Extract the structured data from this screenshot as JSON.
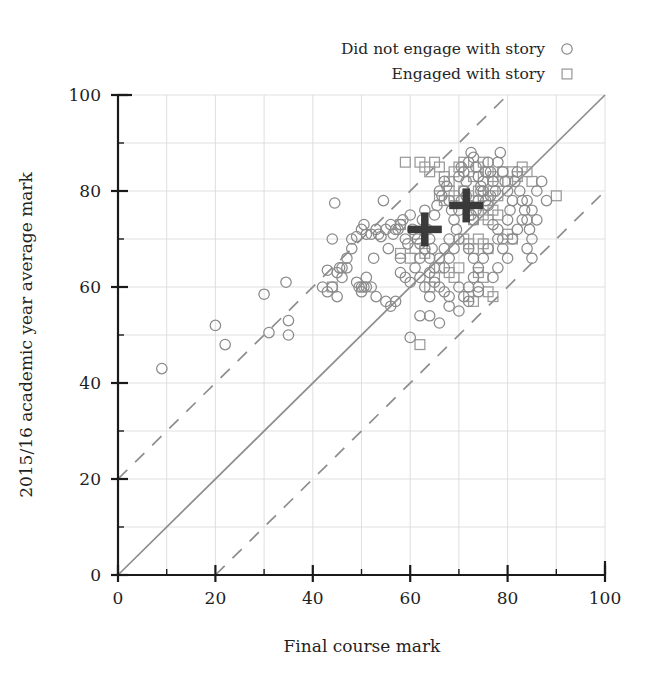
{
  "chart_data": {
    "type": "scatter",
    "title": "",
    "xlabel": "Final course mark",
    "ylabel": "2015/16 academic year average mark",
    "xlim": [
      0,
      100
    ],
    "ylim": [
      0,
      100
    ],
    "xticks": [
      0,
      20,
      40,
      60,
      80,
      100
    ],
    "yticks": [
      0,
      20,
      40,
      60,
      80,
      100
    ],
    "xticklabels": [
      "0",
      "20",
      "40",
      "60",
      "80",
      "100"
    ],
    "yticklabels": [
      "0",
      "20",
      "40",
      "60",
      "80",
      "100"
    ],
    "minor_tick_step": 10,
    "grid": true,
    "grid_step": 10,
    "legend_position": "above-right",
    "legend": [
      {
        "label": "Did not engage with story",
        "marker": "circle",
        "color": "#8a8a8a"
      },
      {
        "label": "Engaged with story",
        "marker": "square",
        "color": "#9a9a9a"
      }
    ],
    "reference_lines": [
      {
        "name": "identity",
        "style": "solid",
        "color": "#8d8d8d",
        "intercept": 0,
        "slope": 1
      },
      {
        "name": "upper-band",
        "style": "dashed",
        "color": "#8d8d8d",
        "intercept": 20,
        "slope": 1
      },
      {
        "name": "lower-band",
        "style": "dashed",
        "color": "#8d8d8d",
        "intercept": -20,
        "slope": 1
      }
    ],
    "centroids": [
      {
        "name": "did-not-engage-mean",
        "x": 63,
        "y": 72,
        "marker": "plus",
        "color": "#3a3a3a"
      },
      {
        "name": "engaged-mean",
        "x": 71.5,
        "y": 77,
        "marker": "plus",
        "color": "#3a3a3a"
      }
    ],
    "series": [
      {
        "name": "Did not engage with story",
        "marker": "circle",
        "color": "#8a8a8a",
        "points": [
          [
            9,
            43
          ],
          [
            20,
            52
          ],
          [
            22,
            48
          ],
          [
            30,
            58.5
          ],
          [
            31,
            50.5
          ],
          [
            35,
            50
          ],
          [
            34.5,
            61
          ],
          [
            35,
            53
          ],
          [
            43,
            63.5
          ],
          [
            44,
            70
          ],
          [
            44.5,
            77.5
          ],
          [
            45,
            63
          ],
          [
            45.5,
            64
          ],
          [
            46,
            64
          ],
          [
            47,
            64
          ],
          [
            48,
            70
          ],
          [
            49,
            70.5
          ],
          [
            49.5,
            60
          ],
          [
            50,
            60
          ],
          [
            50.5,
            60
          ],
          [
            51,
            60
          ],
          [
            50,
            72
          ],
          [
            50.5,
            73
          ],
          [
            51,
            71
          ],
          [
            52,
            71
          ],
          [
            52.5,
            66
          ],
          [
            53,
            72
          ],
          [
            53.5,
            71
          ],
          [
            54,
            70.5
          ],
          [
            54.5,
            78
          ],
          [
            55,
            72
          ],
          [
            55.5,
            68
          ],
          [
            56,
            73
          ],
          [
            56.5,
            71
          ],
          [
            57,
            72
          ],
          [
            57.5,
            72
          ],
          [
            55,
            57
          ],
          [
            56,
            56
          ],
          [
            57,
            57
          ],
          [
            58,
            66
          ],
          [
            58,
            73
          ],
          [
            58.5,
            74
          ],
          [
            59,
            70
          ],
          [
            59.5,
            69
          ],
          [
            60,
            75
          ],
          [
            60.5,
            72
          ],
          [
            61,
            71
          ],
          [
            61.5,
            70
          ],
          [
            62,
            69
          ],
          [
            62.5,
            74
          ],
          [
            63,
            76
          ],
          [
            63.5,
            72
          ],
          [
            64,
            70
          ],
          [
            64.5,
            68
          ],
          [
            65,
            75
          ],
          [
            65.5,
            77
          ],
          [
            66,
            80
          ],
          [
            66.5,
            79
          ],
          [
            67,
            82
          ],
          [
            67.5,
            81
          ],
          [
            68,
            78
          ],
          [
            68.5,
            76
          ],
          [
            69,
            74
          ],
          [
            69.5,
            72
          ],
          [
            70,
            70
          ],
          [
            58,
            63
          ],
          [
            59,
            62
          ],
          [
            60,
            61
          ],
          [
            61,
            64
          ],
          [
            62,
            62
          ],
          [
            63,
            60
          ],
          [
            64,
            63
          ],
          [
            65,
            61
          ],
          [
            60,
            49.5
          ],
          [
            62,
            54
          ],
          [
            64,
            58
          ],
          [
            66,
            60
          ],
          [
            67,
            64
          ],
          [
            68,
            66
          ],
          [
            69,
            68
          ],
          [
            70,
            83
          ],
          [
            70.5,
            85
          ],
          [
            71,
            84
          ],
          [
            71.5,
            82
          ],
          [
            72,
            86
          ],
          [
            72.5,
            88
          ],
          [
            73,
            87
          ],
          [
            73.5,
            85
          ],
          [
            74,
            83
          ],
          [
            74.5,
            81
          ],
          [
            75,
            80
          ],
          [
            75.5,
            78
          ],
          [
            76,
            77
          ],
          [
            76.5,
            79
          ],
          [
            70,
            76
          ],
          [
            70.5,
            78
          ],
          [
            71,
            80
          ],
          [
            71.5,
            79
          ],
          [
            72,
            77
          ],
          [
            72.5,
            75
          ],
          [
            73,
            74
          ],
          [
            73.5,
            76
          ],
          [
            74,
            78
          ],
          [
            74.5,
            80
          ],
          [
            75,
            82
          ],
          [
            75.5,
            84
          ],
          [
            76,
            86
          ],
          [
            76.5,
            84
          ],
          [
            77,
            82
          ],
          [
            77.5,
            80
          ],
          [
            78,
            86
          ],
          [
            78.5,
            88
          ],
          [
            79,
            84
          ],
          [
            79.5,
            82
          ],
          [
            80,
            80
          ],
          [
            77,
            73
          ],
          [
            78,
            72
          ],
          [
            79,
            70
          ],
          [
            80,
            74
          ],
          [
            80.5,
            76
          ],
          [
            81,
            78
          ],
          [
            81.5,
            82
          ],
          [
            82,
            84
          ],
          [
            82.5,
            80
          ],
          [
            83,
            78
          ],
          [
            83.5,
            76
          ],
          [
            84,
            74
          ],
          [
            84.5,
            72
          ],
          [
            85,
            70
          ],
          [
            72,
            68
          ],
          [
            73,
            66
          ],
          [
            74,
            64
          ],
          [
            75,
            66
          ],
          [
            76,
            68
          ],
          [
            77,
            62
          ],
          [
            78,
            64
          ],
          [
            67,
            59
          ],
          [
            68,
            58
          ],
          [
            70,
            60
          ],
          [
            71,
            58
          ],
          [
            72,
            60
          ],
          [
            73,
            62
          ],
          [
            74,
            60
          ],
          [
            64,
            54
          ],
          [
            66,
            52.5
          ],
          [
            68,
            56
          ],
          [
            70,
            55
          ],
          [
            72,
            57
          ],
          [
            74,
            59
          ],
          [
            62,
            66
          ],
          [
            63,
            68
          ],
          [
            64,
            66
          ],
          [
            65,
            64
          ],
          [
            66,
            66
          ],
          [
            67,
            68
          ],
          [
            68,
            70
          ],
          [
            49,
            61
          ],
          [
            50,
            59
          ],
          [
            51,
            62
          ],
          [
            52,
            60
          ],
          [
            53,
            58
          ],
          [
            47,
            66
          ],
          [
            48,
            68
          ],
          [
            44,
            60
          ],
          [
            45,
            58
          ],
          [
            46,
            62
          ],
          [
            43,
            59
          ],
          [
            42,
            60
          ],
          [
            86,
            80
          ],
          [
            87,
            82
          ],
          [
            88,
            78
          ],
          [
            85,
            76
          ],
          [
            86,
            74
          ],
          [
            84,
            68
          ],
          [
            85,
            66
          ],
          [
            78,
            70
          ],
          [
            79,
            68
          ],
          [
            80,
            66
          ],
          [
            81,
            70
          ],
          [
            82,
            72
          ],
          [
            83,
            74
          ],
          [
            84,
            78
          ]
        ]
      },
      {
        "name": "Engaged with story",
        "marker": "square",
        "color": "#9a9a9a",
        "points": [
          [
            44,
            60
          ],
          [
            58,
            73
          ],
          [
            59,
            86
          ],
          [
            62,
            86
          ],
          [
            63,
            85
          ],
          [
            64,
            84
          ],
          [
            65,
            86
          ],
          [
            66,
            85
          ],
          [
            67,
            83
          ],
          [
            68,
            82
          ],
          [
            69,
            84
          ],
          [
            70,
            85
          ],
          [
            71,
            86
          ],
          [
            72,
            84
          ],
          [
            73,
            83
          ],
          [
            74,
            85
          ],
          [
            75,
            86
          ],
          [
            76,
            84
          ],
          [
            77,
            83
          ],
          [
            78,
            82
          ],
          [
            79,
            84
          ],
          [
            66,
            79
          ],
          [
            67,
            78
          ],
          [
            68,
            80
          ],
          [
            69,
            79
          ],
          [
            70,
            78
          ],
          [
            71,
            80
          ],
          [
            72,
            79
          ],
          [
            73,
            78
          ],
          [
            74,
            80
          ],
          [
            75,
            79
          ],
          [
            76,
            78
          ],
          [
            77,
            80
          ],
          [
            78,
            79
          ],
          [
            72,
            75
          ],
          [
            73,
            74
          ],
          [
            74,
            76
          ],
          [
            75,
            75
          ],
          [
            76,
            74
          ],
          [
            77,
            76
          ],
          [
            78,
            75
          ],
          [
            71,
            70
          ],
          [
            72,
            69
          ],
          [
            73,
            68
          ],
          [
            74,
            70
          ],
          [
            75,
            69
          ],
          [
            76,
            68
          ],
          [
            68,
            63
          ],
          [
            69,
            62
          ],
          [
            70,
            64
          ],
          [
            74,
            63
          ],
          [
            75,
            62
          ],
          [
            72,
            58
          ],
          [
            73,
            57
          ],
          [
            76,
            59
          ],
          [
            77,
            58
          ],
          [
            80,
            82
          ],
          [
            81,
            84
          ],
          [
            82,
            83
          ],
          [
            83,
            85
          ],
          [
            84,
            84
          ],
          [
            85,
            82
          ],
          [
            58,
            67
          ],
          [
            60,
            66
          ],
          [
            61,
            68
          ],
          [
            63,
            67
          ],
          [
            90,
            79
          ],
          [
            80,
            71
          ],
          [
            81,
            70
          ],
          [
            62,
            48
          ],
          [
            64,
            60
          ],
          [
            65,
            62
          ],
          [
            66,
            64
          ]
        ]
      }
    ]
  },
  "axes": {
    "x_label": "Final course mark",
    "y_label": "2015/16 academic year average mark"
  }
}
